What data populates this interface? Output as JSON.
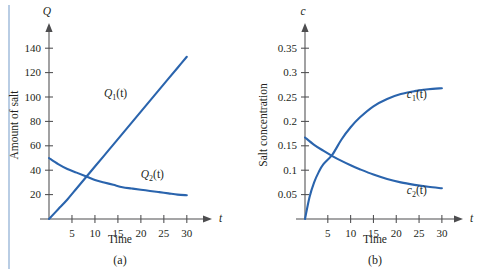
{
  "figure": {
    "left_rule_color": "#b9cde4",
    "axis_color": "#4d4d4f",
    "curve_color": "#2a64ad",
    "background": "#ffffff"
  },
  "panels": [
    {
      "caption": "(a)",
      "y_axis_name": "Q",
      "x_axis_name": "t",
      "chart_data": {
        "type": "line",
        "title": "",
        "xlabel": "Time",
        "ylabel": "Amount of salt",
        "xlim": [
          0,
          32
        ],
        "ylim": [
          0,
          150
        ],
        "xticks": [
          5,
          10,
          15,
          20,
          25,
          30
        ],
        "yticks": [
          20,
          40,
          60,
          80,
          100,
          120,
          140
        ],
        "xtick_labels": [
          "5",
          "10",
          "15",
          "20",
          "25",
          "30"
        ],
        "ytick_labels": [
          "20",
          "40",
          "60",
          "80",
          "100",
          "120",
          "140"
        ],
        "grid": false,
        "legend_position": "inline-curve-labels",
        "series": [
          {
            "name": "Q1(t)",
            "label_base": "Q",
            "label_sub": "1",
            "label_arg": "(t)",
            "x": [
              0,
              2,
              4,
              6,
              8,
              10,
              12,
              14,
              16,
              18,
              20,
              22,
              24,
              26,
              28,
              30
            ],
            "values": [
              0,
              8,
              16,
              25,
              34,
              43,
              52,
              61,
              70,
              79,
              88,
              97,
              106,
              115,
              124,
              133
            ]
          },
          {
            "name": "Q2(t)",
            "label_base": "Q",
            "label_sub": "2",
            "label_arg": "(t)",
            "x": [
              0,
              2,
              4,
              6,
              8,
              10,
              12,
              14,
              16,
              18,
              20,
              22,
              24,
              26,
              28,
              30
            ],
            "values": [
              50,
              45,
              41,
              38,
              35,
              32,
              30,
              28,
              26,
              25,
              24,
              23,
              22,
              21,
              20,
              19.5
            ]
          }
        ],
        "annotations": [
          {
            "text": "Q1(t)",
            "x": 14.5,
            "y": 100
          },
          {
            "text": "Q2(t)",
            "x": 22.5,
            "y": 34
          }
        ]
      }
    },
    {
      "caption": "(b)",
      "y_axis_name": "c",
      "x_axis_name": "t",
      "chart_data": {
        "type": "line",
        "title": "",
        "xlabel": "Time",
        "ylabel": "Salt concentration",
        "xlim": [
          0,
          32
        ],
        "ylim": [
          0,
          0.375
        ],
        "xticks": [
          5,
          10,
          15,
          20,
          25,
          30
        ],
        "yticks": [
          0.05,
          0.1,
          0.15,
          0.2,
          0.25,
          0.3,
          0.35
        ],
        "xtick_labels": [
          "5",
          "10",
          "15",
          "20",
          "25",
          "30"
        ],
        "ytick_labels": [
          "0.05",
          "0.1",
          "0.15",
          "0.2",
          "0.25",
          "0.3",
          "0.35"
        ],
        "grid": false,
        "legend_position": "inline-curve-labels",
        "series": [
          {
            "name": "c1(t)",
            "label_base": "c",
            "label_sub": "1",
            "label_arg": "(t)",
            "x": [
              0,
              1,
              2,
              3,
              4,
              6,
              8,
              10,
              12,
              15,
              18,
              21,
              24,
              27,
              30
            ],
            "values": [
              0,
              0.045,
              0.075,
              0.096,
              0.112,
              0.132,
              0.163,
              0.188,
              0.208,
              0.231,
              0.246,
              0.256,
              0.262,
              0.266,
              0.268
            ]
          },
          {
            "name": "c2(t)",
            "label_base": "c",
            "label_sub": "2",
            "label_arg": "(t)",
            "x": [
              0,
              2,
              4,
              6,
              8,
              10,
              12,
              15,
              18,
              21,
              24,
              27,
              30
            ],
            "values": [
              0.167,
              0.152,
              0.14,
              0.129,
              0.119,
              0.11,
              0.102,
              0.091,
              0.082,
              0.075,
              0.07,
              0.066,
              0.063
            ]
          }
        ],
        "annotations": [
          {
            "text": "c1(t)",
            "x": 24.5,
            "y": 0.247
          },
          {
            "text": "c2(t)",
            "x": 24.5,
            "y": 0.052
          }
        ]
      }
    }
  ]
}
